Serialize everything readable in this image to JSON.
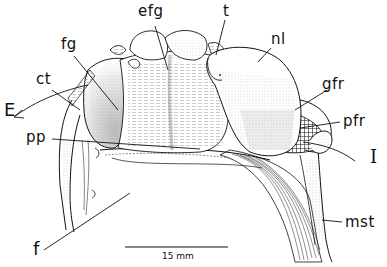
{
  "figure": {
    "type": "anatomical-line-drawing",
    "labels": [
      {
        "id": "efg",
        "text": "efg",
        "x": 138,
        "y": 4
      },
      {
        "id": "t",
        "text": "t",
        "x": 223,
        "y": 4
      },
      {
        "id": "fg",
        "text": "fg",
        "x": 61,
        "y": 37
      },
      {
        "id": "nl",
        "text": "nl",
        "x": 271,
        "y": 32
      },
      {
        "id": "ct",
        "text": "ct",
        "x": 36,
        "y": 72
      },
      {
        "id": "E",
        "text": "E",
        "x": 4,
        "y": 103
      },
      {
        "id": "gfr",
        "text": "gfr",
        "x": 322,
        "y": 77
      },
      {
        "id": "pfr",
        "text": "pfr",
        "x": 343,
        "y": 114
      },
      {
        "id": "pp",
        "text": "pp",
        "x": 26,
        "y": 130
      },
      {
        "id": "I",
        "text": "I",
        "x": 373,
        "y": 150
      },
      {
        "id": "mst",
        "text": "mst",
        "x": 345,
        "y": 215
      },
      {
        "id": "f",
        "text": "f",
        "x": 33,
        "y": 242
      }
    ],
    "scale_bar": {
      "label": "15 mm",
      "x1": 125,
      "x2": 228,
      "y": 247
    }
  },
  "colors": {
    "ink": "#111111",
    "paper": "#ffffff",
    "stipple": "#888888"
  }
}
